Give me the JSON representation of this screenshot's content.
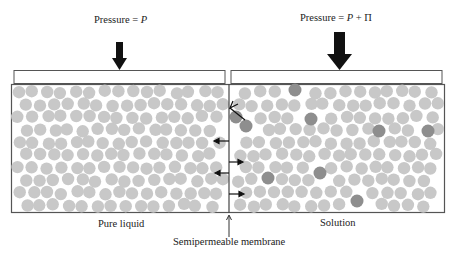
{
  "labels": {
    "left_pressure_prefix": "Pressure = ",
    "left_pressure_var": "P",
    "right_pressure_prefix": "Pressure = ",
    "right_pressure_var": "P",
    "right_pressure_suffix": " + Π",
    "pure_liquid": "Pure liquid",
    "solution": "Solution",
    "membrane": "Semipermeable membrane"
  },
  "colors": {
    "solvent": "#c8c8c8",
    "solute": "#8e8e8e",
    "outline": "#555555",
    "arrow": "#111111"
  },
  "solute_positions": [
    [
      295,
      90
    ],
    [
      246,
      126
    ],
    [
      311,
      119
    ],
    [
      379,
      131
    ],
    [
      428,
      131
    ],
    [
      268,
      178
    ],
    [
      320,
      173
    ],
    [
      357,
      201
    ],
    [
      236,
      117
    ]
  ]
}
